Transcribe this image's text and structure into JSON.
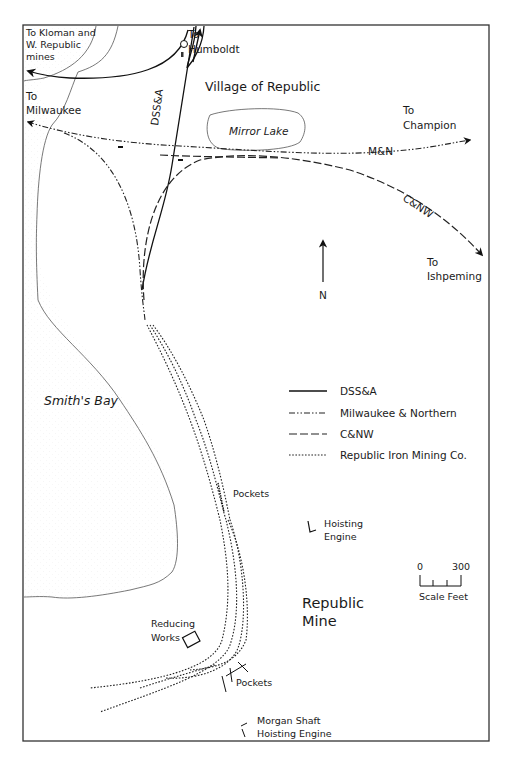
{
  "map": {
    "frame": {
      "left": 23,
      "top": 25,
      "right": 489,
      "bottom": 741
    },
    "place_labels": {
      "to_kloman_line1": "To Kloman and",
      "to_kloman_line2": "W. Republic",
      "to_kloman_line3": "mines",
      "to_humboldt_line1": "To",
      "to_humboldt_line2": "Humboldt",
      "village": "Village of Republic",
      "to_milwaukee_line1": "To",
      "to_milwaukee_line2": "Milwaukee",
      "mirror_lake": "Mirror Lake",
      "to_champion_line1": "To",
      "to_champion_line2": "Champion",
      "to_ishpeming_line1": "To",
      "to_ishpeming_line2": "Ishpeming",
      "smiths_bay": "Smith's Bay",
      "pockets_upper": "Pockets",
      "hoisting_engine_line1": "Hoisting",
      "hoisting_engine_line2": "Engine",
      "republic_mine_line1": "Republic",
      "republic_mine_line2": "Mine",
      "reducing_works_line1": "Reducing",
      "reducing_works_line2": "Works",
      "pockets_lower": "Pockets",
      "morgan_line1": "Morgan Shaft",
      "morgan_line2": "Hoisting Engine"
    },
    "line_labels": {
      "dssa": "DSS&A",
      "mn": "M&N",
      "cnw": "C&NW"
    },
    "north_arrow": {
      "label": "N"
    },
    "scale": {
      "min_label": "0",
      "max_label": "300",
      "unit_label": "Scale Feet"
    },
    "legend": {
      "items": [
        {
          "style": "solid",
          "label": "DSS&A"
        },
        {
          "style": "dash-dot",
          "label": "Milwaukee & Northern"
        },
        {
          "style": "dashed",
          "label": "C&NW"
        },
        {
          "style": "dotted",
          "label": "Republic Iron Mining Co."
        }
      ]
    },
    "colors": {
      "ink": "#1a1a1a",
      "shoreline": "#555555",
      "background": "#ffffff"
    }
  }
}
